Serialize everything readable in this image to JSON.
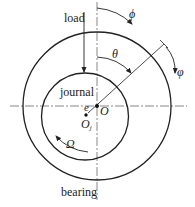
{
  "diagram": {
    "type": "journal-bearing-schematic",
    "labels": {
      "load": "load",
      "journal": "journal",
      "bearing": "bearing",
      "phi_upper": "ϕ",
      "theta": "θ",
      "phi_lower": "φ",
      "eccentricity": "e",
      "bearing_center": "O",
      "journal_center_base": "O",
      "journal_center_sub": "j",
      "rotation": "Ω"
    },
    "colors": {
      "stroke": "#222222",
      "centerline": "#555555",
      "background": "#ffffff"
    },
    "geometry": {
      "bearing_circle": {
        "cx": 97,
        "cy": 106,
        "r": 74
      },
      "journal_circle": {
        "cx": 85,
        "cy": 116,
        "r": 44
      },
      "bearing_center": {
        "x": 97,
        "y": 106
      },
      "journal_center": {
        "x": 86,
        "y": 115
      }
    }
  }
}
